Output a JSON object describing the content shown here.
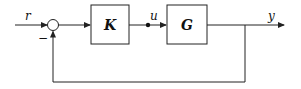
{
  "diagram": {
    "type": "feedback-control-block-diagram",
    "signals": {
      "reference": "r",
      "control": "u",
      "output": "y",
      "feedback_sign": "−"
    },
    "blocks": [
      {
        "id": "controller",
        "label": "K"
      },
      {
        "id": "plant",
        "label": "G"
      }
    ],
    "summing_junction": {
      "inputs": [
        "r",
        "-y"
      ],
      "output": "e"
    },
    "colors": {
      "stroke": "#222222",
      "background": "#ffffff"
    }
  }
}
